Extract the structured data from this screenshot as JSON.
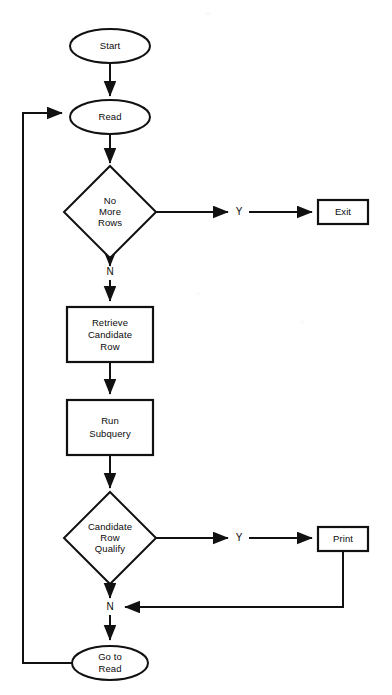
{
  "page": {
    "background_color": "#ffffff",
    "ink_color": "#111111",
    "width": 392,
    "height": 695,
    "header_mark": ""
  },
  "nodes": {
    "start": {
      "label": "Start",
      "shape": "ellipse"
    },
    "read": {
      "label": "Read",
      "shape": "ellipse"
    },
    "no_more_rows": {
      "label_line1": "No",
      "label_line2": "More",
      "label_line3": "Rows",
      "shape": "diamond"
    },
    "exit": {
      "label": "Exit",
      "shape": "rectangle"
    },
    "retrieve_candidate_row": {
      "label_line1": "Retrieve",
      "label_line2": "Candidate",
      "label_line3": "Row",
      "shape": "rectangle"
    },
    "run_subquery": {
      "label_line1": "Run",
      "label_line2": "Subquery",
      "shape": "rectangle"
    },
    "candidate_row_qualify": {
      "label_line1": "Candidate",
      "label_line2": "Row",
      "label_line3": "Qualify",
      "shape": "diamond"
    },
    "print": {
      "label": "Print",
      "shape": "rectangle"
    },
    "go_to_read": {
      "label_line1": "Go to",
      "label_line2": "Read",
      "shape": "ellipse"
    }
  },
  "branch_labels": {
    "no_more_rows_yes": "Y",
    "no_more_rows_no": "N",
    "candidate_qualify_yes": "Y",
    "candidate_qualify_no": "N"
  }
}
